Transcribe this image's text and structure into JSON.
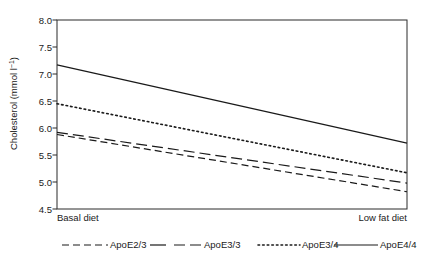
{
  "chart_data": {
    "type": "line",
    "title": "",
    "xlabel": "",
    "ylabel": "Cholesterol (mmol l",
    "ylabel_superscript": "−1",
    "ylabel_suffix": ")",
    "categories": [
      "Basal diet",
      "Low fat diet"
    ],
    "x": [
      0,
      1
    ],
    "ylim": [
      4.5,
      8.0
    ],
    "yticks": [
      "4.5",
      "5.0",
      "5.5",
      "6.0",
      "6.5",
      "7.0",
      "7.5",
      "8.0"
    ],
    "ytick_values": [
      4.5,
      5.0,
      5.5,
      6.0,
      6.5,
      7.0,
      7.5,
      8.0
    ],
    "grid": false,
    "legend_position": "bottom",
    "series": [
      {
        "name": "ApoE2/3",
        "values": [
          5.88,
          4.82
        ],
        "style": "dashed",
        "dasharray": "7,4",
        "width": 1.2,
        "color": "#1a1a1a"
      },
      {
        "name": "ApoE3/3",
        "values": [
          5.92,
          4.98
        ],
        "style": "dashed",
        "dasharray": "11,5",
        "width": 1.2,
        "color": "#1a1a1a"
      },
      {
        "name": "ApoE3/4",
        "values": [
          6.45,
          5.17
        ],
        "style": "dotted",
        "dasharray": "1.6,3",
        "width": 1.6,
        "color": "#1a1a1a"
      },
      {
        "name": "ApoE4/4",
        "values": [
          7.17,
          5.72
        ],
        "style": "solid",
        "dasharray": "none",
        "width": 1.2,
        "color": "#1a1a1a"
      }
    ]
  },
  "legend": {
    "entries": [
      {
        "label": "ApoE2/3",
        "dasharray": "7,4",
        "width": 1.2
      },
      {
        "label": "ApoE3/3",
        "dasharray": "11,5",
        "width": 1.2
      },
      {
        "label": "ApoE3/4",
        "dasharray": "1.6,3",
        "width": 1.6
      },
      {
        "label": "ApoE4/4",
        "dasharray": "none",
        "width": 1.2
      }
    ]
  },
  "colors": {
    "ink": "#1a1a1a",
    "axis": "#2b2b2b",
    "background": "#ffffff"
  }
}
